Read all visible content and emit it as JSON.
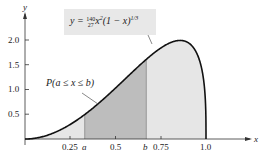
{
  "chart_data": {
    "type": "area",
    "title": "",
    "equation": "y = (140/27) x^2 (1 - x)^(1/3)",
    "xlabel": "x",
    "ylabel": "y",
    "xlim": [
      0,
      1.2
    ],
    "ylim": [
      0,
      2.2
    ],
    "x_ticks": [
      "0.25",
      "0.5",
      "0.75",
      "1.0"
    ],
    "y_ticks": [
      "0.5",
      "1.0",
      "1.5",
      "2.0"
    ],
    "shaded_interval": {
      "a": 0.33,
      "b": 0.67,
      "label": "P(a ≤ x ≤ b)"
    },
    "curve_points": [
      [
        0,
        0
      ],
      [
        0.1,
        0.047
      ],
      [
        0.2,
        0.193
      ],
      [
        0.3,
        0.415
      ],
      [
        0.4,
        0.7
      ],
      [
        0.5,
        1.029
      ],
      [
        0.6,
        1.368
      ],
      [
        0.7,
        1.708
      ],
      [
        0.8,
        1.94
      ],
      [
        0.85,
        1.993
      ],
      [
        0.9,
        1.95
      ],
      [
        0.95,
        1.74
      ],
      [
        1.0,
        0
      ]
    ]
  },
  "labels": {
    "x_axis": "x",
    "y_axis": "y",
    "tick_025": "0.25",
    "tick_a": "a",
    "tick_05": "0.5",
    "tick_b": "b",
    "tick_075": "0.75",
    "tick_10": "1.0",
    "ytick_05": "0.5",
    "ytick_10": "1.0",
    "ytick_15": "1.5",
    "ytick_20": "2.0",
    "equation": "y = 140⁄27 x²(1 − x)^1/3",
    "probability": "P(a ≤ x ≤ b)"
  }
}
